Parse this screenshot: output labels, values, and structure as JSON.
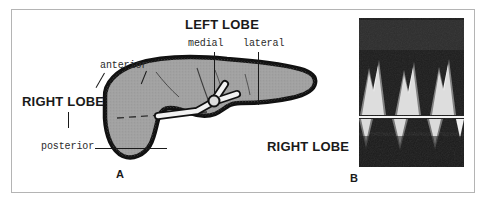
{
  "figure": {
    "panel_a_letter": "A",
    "panel_b_letter": "B",
    "labels": {
      "left_lobe": "LEFT LOBE",
      "right_lobe_diagram": "RIGHT LOBE",
      "right_lobe_ultrasound": "RIGHT LOBE",
      "medial": "medial",
      "lateral": "lateral",
      "anterior": "anterior",
      "posterior": "posterior"
    },
    "colors": {
      "frame_border": "#b4b4b4",
      "liver_fill": "#a2a2a2",
      "liver_outline": "#111111",
      "vessel_fill": "#f2f2f2",
      "ultrasound_background": "#1d1d1d",
      "ultrasound_trace": "#f5f5f5",
      "text": "#1a1a1a",
      "page_background": "#ffffff"
    },
    "panel_a": {
      "description": "Schematic transverse section of the liver showing right and left lobes with the portal vein bifurcation",
      "structures": [
        "right lobe",
        "left lobe medial segment",
        "left lobe lateral segment",
        "portal vein bifurcation",
        "anterior surface",
        "posterior surface"
      ]
    },
    "panel_b": {
      "description": "Doppler spectral waveform tracing from the right lobe showing triphasic hepatic venous flow",
      "waveform_cycles": 3,
      "baseline_present": true
    }
  }
}
